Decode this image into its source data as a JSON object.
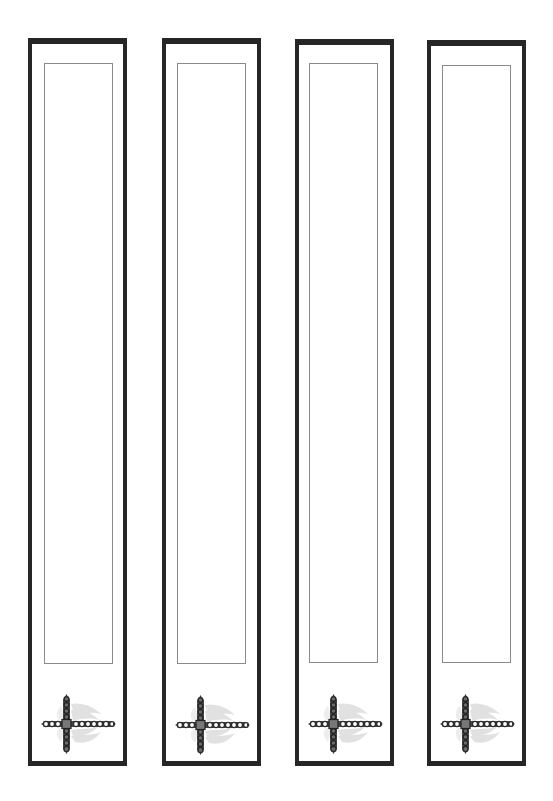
{
  "page": {
    "background": "#ffffff"
  },
  "style": {
    "frame_color": "#262626",
    "inner_border_color": "#8a8a8a",
    "cross_color": "#3a3a3a",
    "wing_color": "#d6d6d6"
  },
  "bookmarks": [
    {
      "id": 1,
      "ornament": "jeweled-cross-with-wings-icon",
      "text": ""
    },
    {
      "id": 2,
      "ornament": "jeweled-cross-with-wings-icon",
      "text": ""
    },
    {
      "id": 3,
      "ornament": "jeweled-cross-with-wings-icon",
      "text": ""
    },
    {
      "id": 4,
      "ornament": "jeweled-cross-with-wings-icon",
      "text": ""
    }
  ]
}
